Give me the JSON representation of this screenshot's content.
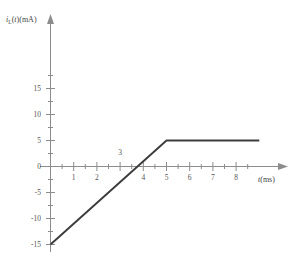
{
  "chart_data": {
    "type": "line",
    "title": "",
    "subtitle": "",
    "xlabel": "t(ms)",
    "ylabel": "i_L(t)(mA)",
    "ylabel_parts": {
      "symbol": "i",
      "subscript": "L",
      "argument": "(t)",
      "units": "(mA)"
    },
    "xlabel_parts": {
      "symbol": "t",
      "units": "(ms)"
    },
    "xlim": [
      0,
      9.2
    ],
    "ylim": [
      -17.5,
      21
    ],
    "grid": false,
    "legend": null,
    "x_ticks_major": [
      1,
      2,
      3,
      4,
      5,
      6,
      7,
      8
    ],
    "x_ticks_minor": [
      0.5,
      1.5,
      2.5,
      3.5,
      4.5,
      5.5,
      6.5,
      7.5,
      8.5
    ],
    "x_ticklabels": [
      "1",
      "2",
      "3",
      "4",
      "5",
      "6",
      "7",
      "8"
    ],
    "y_ticks_major": [
      -15,
      -10,
      -5,
      0,
      5,
      10,
      15
    ],
    "y_ticks_minor": [
      -12.5,
      -7.5,
      -2.5,
      2.5,
      7.5,
      12.5,
      17.5
    ],
    "y_ticklabels": [
      "-15",
      "-10",
      "-5",
      "0",
      "5",
      "10",
      "15"
    ],
    "series": [
      {
        "name": "i_L(t)",
        "color": "#3c3c3c",
        "x": [
          0,
          5,
          9
        ],
        "values": [
          -15,
          5,
          5
        ]
      }
    ],
    "annotations": [
      {
        "text": "3",
        "x": 3,
        "y": 2.0,
        "note": "x tick label 3 placed above axis"
      }
    ],
    "colors": {
      "axis": "#8c8c8c",
      "curve": "#3c3c3c",
      "ticklabel": "#555555",
      "background": "#ffffff"
    }
  }
}
